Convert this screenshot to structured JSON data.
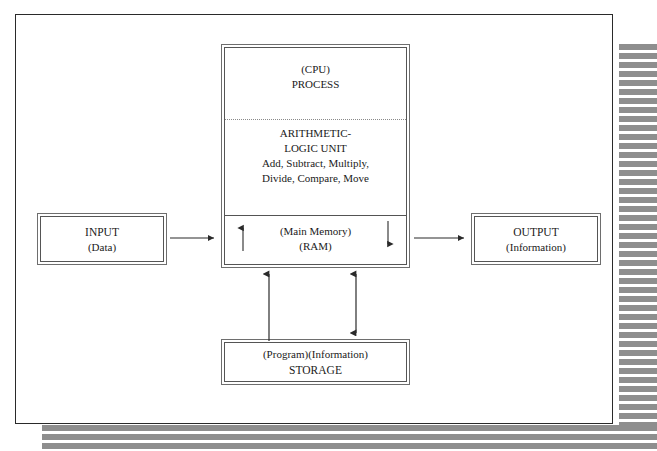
{
  "diagram": {
    "colors": {
      "ink": "#1a1a1a",
      "frame": "#2a2a2a",
      "box_border": "#555555",
      "shadow_stripe": "#8e8e8e",
      "page_background": "#ffffff"
    },
    "input": {
      "label": "INPUT",
      "sublabel": "(Data)"
    },
    "output": {
      "label": "OUTPUT",
      "sublabel": "(Information)"
    },
    "cpu": {
      "process": {
        "line1": "(CPU)",
        "line2": "PROCESS"
      },
      "alu": {
        "line1": "ARITHMETIC-",
        "line2": "LOGIC UNIT",
        "line3": "Add, Subtract, Multiply,",
        "line4": "Divide, Compare, Move"
      },
      "memory": {
        "line1": "(Main Memory)",
        "line2": "(RAM)"
      }
    },
    "storage": {
      "line1": "(Program)(Information)",
      "line2": "STORAGE"
    },
    "connectors": [
      {
        "name": "input-to-cpu",
        "direction": "right",
        "from": "INPUT",
        "to": "Main Memory"
      },
      {
        "name": "cpu-to-output",
        "direction": "right",
        "from": "Main Memory",
        "to": "OUTPUT"
      },
      {
        "name": "memory-read-up",
        "direction": "up",
        "from": "Main Memory",
        "to": "ALU"
      },
      {
        "name": "memory-write-down",
        "direction": "down",
        "from": "ALU",
        "to": "Main Memory"
      },
      {
        "name": "storage-to-memory",
        "direction": "up",
        "from": "STORAGE",
        "to": "Main Memory"
      },
      {
        "name": "memory-storage-sync",
        "direction": "bidirectional",
        "from": "Main Memory",
        "to": "STORAGE"
      }
    ]
  }
}
